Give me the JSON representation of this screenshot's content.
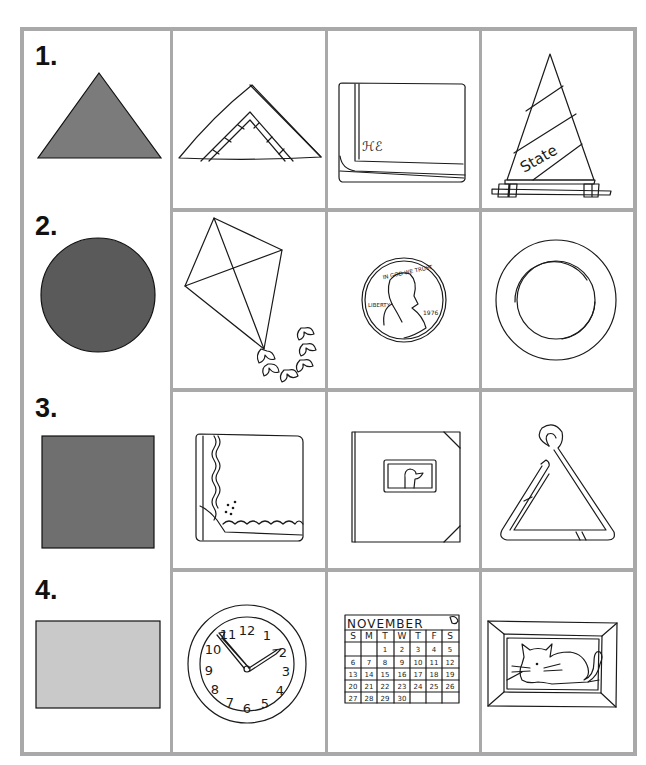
{
  "worksheet": {
    "colors": {
      "grid": "#a9a9a9",
      "triangle": "#7b7b7b",
      "circle": "#5a5a5a",
      "square": "#6f6f6f",
      "rectangle": "#c9c9c9"
    },
    "rows": [
      {
        "number": "1.",
        "shape": "triangle",
        "pictures": [
          {
            "name": "folded-napkin"
          },
          {
            "name": "folded-handkerchief",
            "monogram": "ℋℰ"
          },
          {
            "name": "sailboat-sail",
            "text": "State"
          }
        ]
      },
      {
        "number": "2.",
        "shape": "circle",
        "pictures": [
          {
            "name": "kite"
          },
          {
            "name": "penny",
            "motto": "IN GOD WE TRUST",
            "liberty": "LIBERTY",
            "year": "1976"
          },
          {
            "name": "plate"
          }
        ]
      },
      {
        "number": "3.",
        "shape": "square",
        "pictures": [
          {
            "name": "handkerchief"
          },
          {
            "name": "photo-album"
          },
          {
            "name": "musical-triangle"
          }
        ]
      },
      {
        "number": "4.",
        "shape": "rectangle",
        "pictures": [
          {
            "name": "wall-clock",
            "numerals": [
              "12",
              "1",
              "2",
              "3",
              "4",
              "5",
              "6",
              "7",
              "8",
              "9",
              "10",
              "11"
            ]
          },
          {
            "name": "calendar",
            "month": "NOVEMBER",
            "weekdays": [
              "S",
              "M",
              "T",
              "W",
              "T",
              "F",
              "S"
            ],
            "weeks": [
              [
                "",
                "",
                "1",
                "2",
                "3",
                "4",
                "5"
              ],
              [
                "6",
                "7",
                "8",
                "9",
                "10",
                "11",
                "12"
              ],
              [
                "13",
                "14",
                "15",
                "16",
                "17",
                "18",
                "19"
              ],
              [
                "20",
                "21",
                "22",
                "23",
                "24",
                "25",
                "26"
              ],
              [
                "27",
                "28",
                "29",
                "30",
                "",
                "",
                ""
              ]
            ]
          },
          {
            "name": "framed-cat-picture"
          }
        ]
      }
    ]
  }
}
